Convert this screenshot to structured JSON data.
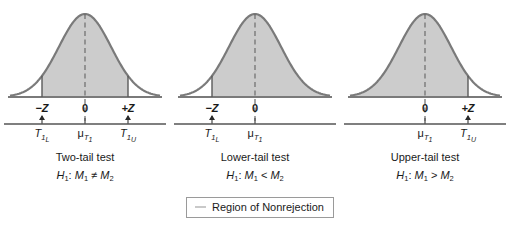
{
  "figure": {
    "shading_label": "Region of Nonrejection",
    "fill_color": "#cccccc",
    "curve_color": "#7a7a7a",
    "axis_color": "#555555"
  },
  "legend": {
    "label": "Region of Nonrejection",
    "swatch_color": "#c9c9c9"
  },
  "panels": [
    {
      "id": "two-tail",
      "title": "Two-tail test",
      "hypothesis_prefix": "H",
      "hypothesis_sub": "1",
      "hypothesis_rest": ": M",
      "hypothesis_sub2": "1",
      "operator": "≠",
      "hypothesis_rest2": " M",
      "hypothesis_sub3": "2",
      "z_ticks": [
        {
          "label": "−Z",
          "x": 42
        },
        {
          "label": "0",
          "x": 85
        },
        {
          "label": "+Z",
          "x": 128
        }
      ],
      "t_ticks": [
        {
          "base": "T",
          "sub": "1",
          "subsub": "L",
          "x": 42
        },
        {
          "base": "μ",
          "sub": "T",
          "subsub": "1",
          "x": 85,
          "is_mu": true
        },
        {
          "base": "T",
          "sub": "1",
          "subsub": "U",
          "x": 128
        }
      ],
      "boundaries": [
        42,
        128
      ],
      "arrows": [
        42,
        128
      ],
      "shade_from": 42,
      "shade_to": 128
    },
    {
      "id": "lower-tail",
      "title": "Lower-tail test",
      "hypothesis_prefix": "H",
      "hypothesis_sub": "1",
      "hypothesis_rest": ": M",
      "hypothesis_sub2": "1",
      "operator": "<",
      "hypothesis_rest2": " M",
      "hypothesis_sub3": "2",
      "z_ticks": [
        {
          "label": "−Z",
          "x": 42
        },
        {
          "label": "0",
          "x": 85
        }
      ],
      "t_ticks": [
        {
          "base": "T",
          "sub": "1",
          "subsub": "L",
          "x": 42
        },
        {
          "base": "μ",
          "sub": "T",
          "subsub": "1",
          "x": 85,
          "is_mu": true
        }
      ],
      "boundaries": [
        42
      ],
      "arrows": [
        42
      ],
      "shade_from": 42,
      "shade_to": 160
    },
    {
      "id": "upper-tail",
      "title": "Upper-tail test",
      "hypothesis_prefix": "H",
      "hypothesis_sub": "1",
      "hypothesis_rest": ": M",
      "hypothesis_sub2": "1",
      "operator": ">",
      "hypothesis_rest2": " M",
      "hypothesis_sub3": "2",
      "z_ticks": [
        {
          "label": "0",
          "x": 85
        },
        {
          "label": "+Z",
          "x": 128
        }
      ],
      "t_ticks": [
        {
          "base": "μ",
          "sub": "T",
          "subsub": "1",
          "x": 85,
          "is_mu": true
        },
        {
          "base": "T",
          "sub": "1",
          "subsub": "U",
          "x": 128
        }
      ],
      "boundaries": [
        128
      ],
      "arrows": [
        128
      ],
      "shade_from": 10,
      "shade_to": 128
    }
  ],
  "chart_data": {
    "type": "area",
    "xlabel": "",
    "ylabel": "",
    "distribution": "standard normal",
    "panels": [
      {
        "name": "Two-tail test",
        "hypothesis": "H1: M1 ≠ M2",
        "z_tick_labels": [
          "−Z",
          "0",
          "+Z"
        ],
        "t_tick_labels": [
          "T1L",
          "μT1",
          "T1U"
        ],
        "critical_values": [
          -1.645,
          1.645
        ],
        "nonrejection_interval": [
          -1.645,
          1.645
        ],
        "rejection_tails": [
          "lower",
          "upper"
        ]
      },
      {
        "name": "Lower-tail test",
        "hypothesis": "H1: M1 < M2",
        "z_tick_labels": [
          "−Z",
          "0"
        ],
        "t_tick_labels": [
          "T1L",
          "μT1"
        ],
        "critical_values": [
          -1.645
        ],
        "nonrejection_interval": [
          -1.645,
          4.0
        ],
        "rejection_tails": [
          "lower"
        ]
      },
      {
        "name": "Upper-tail test",
        "hypothesis": "H1: M1 > M2",
        "z_tick_labels": [
          "0",
          "+Z"
        ],
        "t_tick_labels": [
          "μT1",
          "T1U"
        ],
        "critical_values": [
          1.645
        ],
        "nonrejection_interval": [
          -4.0,
          1.645
        ],
        "rejection_tails": [
          "upper"
        ]
      }
    ],
    "legend": [
      "Region of Nonrejection"
    ],
    "xlim": [
      -4,
      4
    ],
    "ylim": [
      0,
      1
    ],
    "grid": false
  }
}
